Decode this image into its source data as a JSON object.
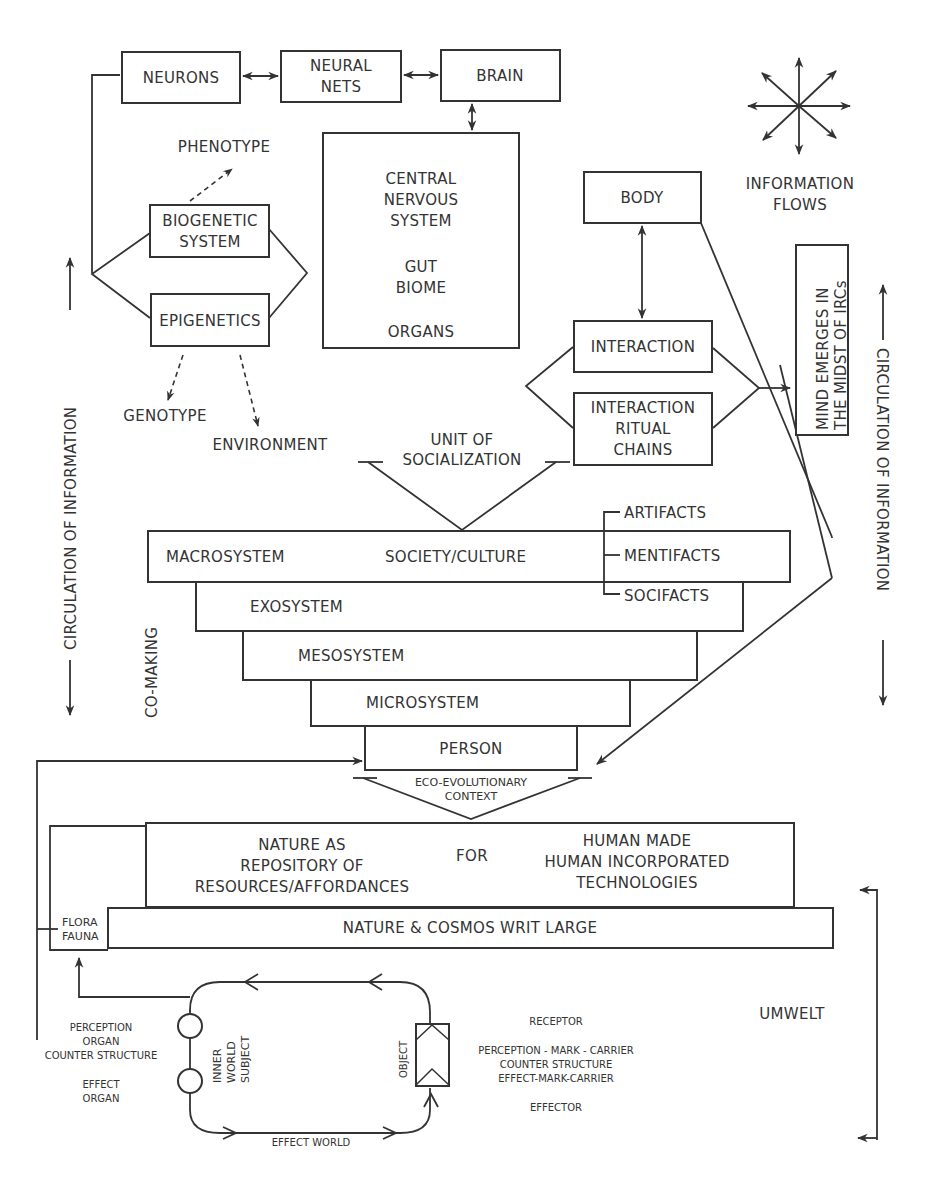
{
  "diagram": {
    "top_chain": {
      "neurons": "NEURONS",
      "neural_nets": [
        "NEURAL",
        "NETS"
      ],
      "brain": "BRAIN"
    },
    "cns_box": {
      "lines": [
        "CENTRAL",
        "NERVOUS",
        "SYSTEM",
        "",
        "GUT",
        "BIOME",
        "",
        "ORGANS"
      ]
    },
    "genetics": {
      "phenotype": "PHENOTYPE",
      "biogenetic": [
        "BIOGENETIC",
        "SYSTEM"
      ],
      "epigenetics": "EPIGENETICS",
      "genotype": "GENOTYPE",
      "environment": "ENVIRONMENT"
    },
    "legend": {
      "icon": "information-flows-star-icon",
      "label": [
        "INFORMATION",
        "FLOWS"
      ]
    },
    "body": "BODY",
    "interaction": "INTERACTION",
    "irc": [
      "INTERACTION",
      "RITUAL",
      "CHAINS"
    ],
    "mind": [
      "MIND EMERGES IN",
      "THE MIDST OF IRCs"
    ],
    "unit_of_socialization": [
      "UNIT OF",
      "SOCIALIZATION"
    ],
    "circulation_left": "CIRCULATION OF INFORMATION",
    "circulation_right": "CIRCULATION OF INFORMATION",
    "co_making": "CO-MAKING",
    "systems": {
      "macrosystem": "MACROSYSTEM",
      "society_culture": "SOCIETY/CULTURE",
      "artifacts": "ARTIFACTS",
      "mentifacts": "MENTIFACTS",
      "socifacts": "SOCIFACTS",
      "exosystem": "EXOSYSTEM",
      "mesosystem": "MESOSYSTEM",
      "microsystem": "MICROSYSTEM",
      "person": "PERSON"
    },
    "eco_context": [
      "ECO-EVOLUTIONARY",
      "CONTEXT"
    ],
    "nature": {
      "repository": [
        "NATURE AS",
        "REPOSITORY OF",
        "RESOURCES/AFFORDANCES"
      ],
      "for": "FOR",
      "technologies": [
        "HUMAN MADE",
        "HUMAN INCORPORATED",
        "TECHNOLOGIES"
      ],
      "cosmos": "NATURE & COSMOS WRIT LARGE",
      "flora_fauna": [
        "FLORA",
        "FAUNA"
      ]
    },
    "umwelt": {
      "label": "UMWELT",
      "perception_organ": [
        "PERCEPTION",
        "ORGAN",
        "COUNTER STRUCTURE"
      ],
      "effect_organ": [
        "EFFECT",
        "ORGAN"
      ],
      "inner_world_subject": [
        "INNER",
        "WORLD",
        "SUBJECT"
      ],
      "object": "OBJECT",
      "receptor": "RECEPTOR",
      "mark_carrier": [
        "PERCEPTION - MARK - CARRIER",
        "COUNTER STRUCTURE",
        "EFFECT-MARK-CARRIER"
      ],
      "effector": "EFFECTOR",
      "effect_world": "EFFECT WORLD"
    }
  }
}
